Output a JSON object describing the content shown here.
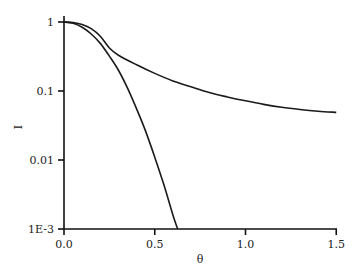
{
  "chart_data": {
    "type": "line",
    "title": "",
    "xlabel": "θ",
    "ylabel": "I",
    "xlim": [
      0.0,
      1.5
    ],
    "ylim": [
      0.001,
      1
    ],
    "yscale": "log",
    "grid": false,
    "legend": null,
    "x_ticks": [
      "0.0",
      "0.5",
      "1.0",
      "1.5"
    ],
    "y_ticks": [
      "1",
      "0.1",
      "0.01",
      "1E-3"
    ],
    "series": [
      {
        "name": "upper curve",
        "x": [
          0.0,
          0.05,
          0.1,
          0.15,
          0.2,
          0.25,
          0.3,
          0.4,
          0.5,
          0.6,
          0.7,
          0.8,
          0.9,
          1.0,
          1.1,
          1.2,
          1.3,
          1.4,
          1.5
        ],
        "y": [
          1.0,
          0.98,
          0.92,
          0.8,
          0.62,
          0.42,
          0.33,
          0.24,
          0.18,
          0.14,
          0.115,
          0.095,
          0.082,
          0.072,
          0.064,
          0.058,
          0.054,
          0.051,
          0.049
        ]
      },
      {
        "name": "lower curve",
        "x": [
          0.0,
          0.05,
          0.1,
          0.15,
          0.2,
          0.25,
          0.3,
          0.35,
          0.4,
          0.45,
          0.5,
          0.55,
          0.6,
          0.626
        ],
        "y": [
          1.0,
          0.96,
          0.84,
          0.67,
          0.49,
          0.32,
          0.2,
          0.11,
          0.055,
          0.026,
          0.011,
          0.0044,
          0.0016,
          0.001
        ]
      }
    ]
  }
}
